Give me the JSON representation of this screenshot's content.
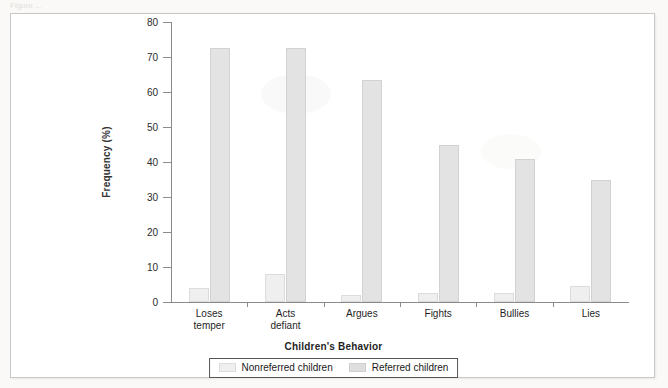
{
  "figure": {
    "caption_fragment": "Figure ..."
  },
  "chart_data": {
    "type": "bar",
    "title": "",
    "xlabel": "Children's Behavior",
    "ylabel": "Frequency (%)",
    "ylim": [
      0,
      80
    ],
    "ytick_labels": [
      "0",
      "10",
      "20",
      "30",
      "40",
      "50",
      "60",
      "70",
      "80"
    ],
    "yticks": [
      0,
      10,
      20,
      30,
      40,
      50,
      60,
      70,
      80
    ],
    "grid": false,
    "legend_position": "bottom",
    "categories": [
      "Loses temper",
      "Acts defiant",
      "Argues",
      "Fights",
      "Bullies",
      "Lies"
    ],
    "category_lines": [
      [
        "Loses",
        "temper"
      ],
      [
        "Acts",
        "defiant"
      ],
      [
        "Argues"
      ],
      [
        "Fights"
      ],
      [
        "Bullies"
      ],
      [
        "Lies"
      ]
    ],
    "series": [
      {
        "name": "Nonreferred children",
        "color": "#efefef",
        "values": [
          4,
          8,
          2,
          2.5,
          2.5,
          4.5
        ]
      },
      {
        "name": "Referred children",
        "color": "#e0e0e0",
        "values": [
          72.5,
          72.5,
          63.5,
          45,
          41,
          35
        ]
      }
    ]
  },
  "legend": {
    "items": [
      {
        "label": "Nonreferred children",
        "swatch": "nonreferred"
      },
      {
        "label": "Referred children",
        "swatch": "referred"
      }
    ]
  }
}
